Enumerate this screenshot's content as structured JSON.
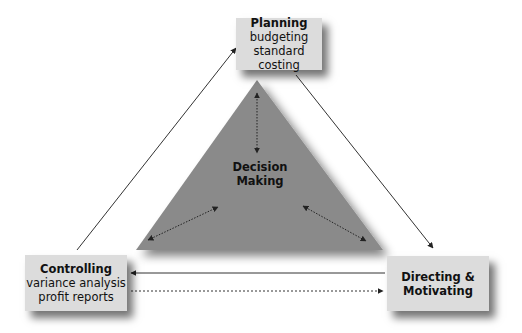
{
  "diagram": {
    "center": {
      "title": "Decision",
      "subtitle": "Making"
    },
    "nodes": {
      "planning": {
        "title": "Planning",
        "lines": [
          "budgeting",
          "standard costing"
        ]
      },
      "controlling": {
        "title": "Controlling",
        "lines": [
          "variance analysis",
          "profit reports"
        ]
      },
      "directing": {
        "title": "Directing &",
        "lines": [
          "Motivating"
        ]
      }
    },
    "edges": [
      {
        "from": "controlling",
        "to": "planning",
        "style": "solid"
      },
      {
        "from": "planning",
        "to": "directing",
        "style": "solid"
      },
      {
        "from": "directing",
        "to": "controlling",
        "style": "solid"
      },
      {
        "from": "controlling",
        "to": "directing",
        "style": "dotted"
      },
      {
        "from": "decision-making",
        "to": "planning",
        "style": "dotted",
        "bidirectional": true
      },
      {
        "from": "decision-making",
        "to": "controlling",
        "style": "dotted",
        "bidirectional": true
      },
      {
        "from": "decision-making",
        "to": "directing",
        "style": "dotted",
        "bidirectional": true
      }
    ],
    "colors": {
      "triangle": "#8a8a8a",
      "box": "#dcdcdc",
      "line": "#333333"
    }
  }
}
